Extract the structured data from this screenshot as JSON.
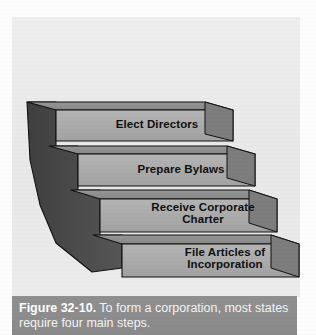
{
  "figure": {
    "panel_background": "#ebebeb",
    "steps": [
      {
        "id": "step-1",
        "order": 1,
        "label": "Elect Directors"
      },
      {
        "id": "step-2",
        "order": 2,
        "label": "Prepare Bylaws"
      },
      {
        "id": "step-3",
        "order": 3,
        "label": "Receive Corporate\nCharter"
      },
      {
        "id": "step-4",
        "order": 4,
        "label": "File Articles of\nIncorporation"
      }
    ],
    "colors": {
      "step_front_face": "#a9a9a9",
      "step_top_face": "#8e8e8e",
      "side_wedge": "#4a4a4a",
      "outline": "#111111",
      "caption_bar": "#8c8c8c",
      "caption_text": "#ffffff",
      "label_text": "#101010"
    }
  },
  "caption": {
    "figure_number": "Figure 32-10.",
    "text": " To form a corporation, most states require four main steps."
  }
}
